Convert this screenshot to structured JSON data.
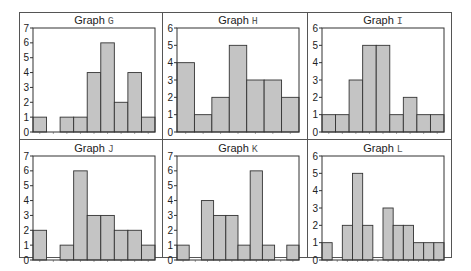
{
  "figure": {
    "bar_fill": "#c4c4c4",
    "bar_stroke": "#333333",
    "frame_color": "#555555"
  },
  "chart_data": [
    {
      "type": "bar",
      "title": "Graph G",
      "title_prefix": "Graph",
      "title_letter": "G",
      "values": [
        1,
        0,
        1,
        1,
        4,
        6,
        2,
        4,
        1
      ],
      "ylim": [
        0,
        7
      ],
      "yticks": [
        0,
        1,
        2,
        3,
        4,
        5,
        6,
        7
      ],
      "xlabel": "",
      "ylabel": "",
      "grid": false
    },
    {
      "type": "bar",
      "title": "Graph H",
      "title_prefix": "Graph",
      "title_letter": "H",
      "values": [
        4,
        1,
        2,
        5,
        3,
        3,
        2
      ],
      "ylim": [
        0,
        6
      ],
      "yticks": [
        0,
        1,
        2,
        3,
        4,
        5,
        6
      ],
      "xlabel": "",
      "ylabel": "",
      "grid": false
    },
    {
      "type": "bar",
      "title": "Graph I",
      "title_prefix": "Graph",
      "title_letter": "I",
      "values": [
        1,
        1,
        3,
        5,
        5,
        1,
        2,
        1,
        1
      ],
      "ylim": [
        0,
        6
      ],
      "yticks": [
        0,
        1,
        2,
        3,
        4,
        5,
        6
      ],
      "xlabel": "",
      "ylabel": "",
      "grid": false
    },
    {
      "type": "bar",
      "title": "Graph J",
      "title_prefix": "Graph",
      "title_letter": "J",
      "values": [
        2,
        0,
        1,
        6,
        3,
        3,
        2,
        2,
        1
      ],
      "ylim": [
        0,
        7
      ],
      "yticks": [
        0,
        1,
        2,
        3,
        4,
        5,
        6,
        7
      ],
      "xlabel": "",
      "ylabel": "",
      "grid": false
    },
    {
      "type": "bar",
      "title": "Graph K",
      "title_prefix": "Graph",
      "title_letter": "K",
      "values": [
        1,
        0,
        4,
        3,
        3,
        1,
        6,
        1,
        0,
        1
      ],
      "ylim": [
        0,
        7
      ],
      "yticks": [
        0,
        1,
        2,
        3,
        4,
        5,
        6,
        7
      ],
      "xlabel": "",
      "ylabel": "",
      "grid": false
    },
    {
      "type": "bar",
      "title": "Graph L",
      "title_prefix": "Graph",
      "title_letter": "L",
      "values": [
        1,
        0,
        2,
        5,
        2,
        0,
        3,
        2,
        2,
        1,
        1,
        1
      ],
      "ylim": [
        0,
        6
      ],
      "yticks": [
        0,
        1,
        2,
        3,
        4,
        5,
        6
      ],
      "xlabel": "",
      "ylabel": "",
      "grid": false
    }
  ]
}
